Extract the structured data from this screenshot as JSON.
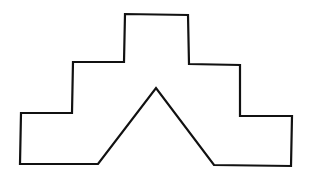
{
  "figure": {
    "stroke_color": "#111111",
    "fill_color": "#ffffff",
    "stroke_width": 2.2,
    "points": "20,164 21,113 72,113 73,62 124,62 125,14 188,15 189,64 240,65 240,116 292,116 291,166 214,165 156,88 98,164"
  }
}
